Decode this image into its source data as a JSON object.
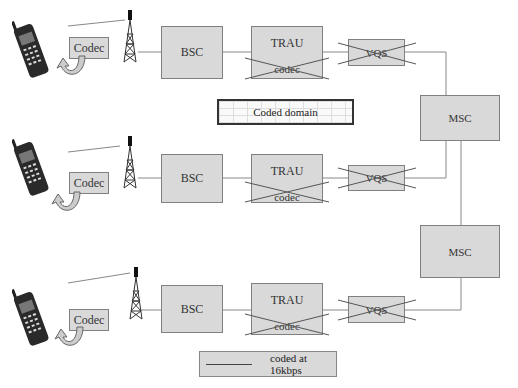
{
  "diagram": {
    "legend": {
      "label": "coded at 16kbps"
    },
    "coded_domain": {
      "label": "Coded domain"
    },
    "rows": [
      {
        "codec": "Codec",
        "bsc": "BSC",
        "trau": "TRAU",
        "trau_codec": "codec",
        "vqs": "VQS"
      },
      {
        "codec": "Codec",
        "bsc": "BSC",
        "trau": "TRAU",
        "trau_codec": "codec",
        "vqs": "VQS"
      },
      {
        "codec": "Codec",
        "bsc": "BSC",
        "trau": "TRAU",
        "trau_codec": "codec",
        "vqs": "VQS"
      }
    ],
    "msc": [
      {
        "label": "MSC"
      },
      {
        "label": "MSC"
      }
    ],
    "icons": [
      "mobile-phone-icon",
      "curved-arrow-icon",
      "antenna-tower-icon"
    ],
    "colors": {
      "box_fill": "#d9d9d9",
      "box_border": "#808080",
      "line": "#888888"
    }
  }
}
